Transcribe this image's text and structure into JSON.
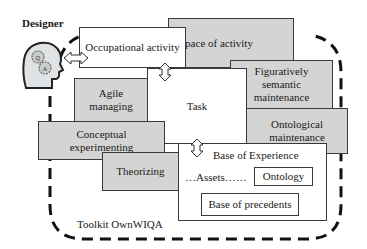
{
  "diagram": {
    "designer_label": "Designer",
    "toolkit_label": "Toolkit OwnWIQA",
    "boxes": {
      "occupational_activity": "Occupational activity",
      "space_of_activity": "Space of activity",
      "agile_managing": "Agile managing",
      "task": "Task",
      "figuratively_semantic_maintenance": "Figuratively semantic maintenance",
      "ontological_maintenance": "Ontological maintenance",
      "conceptual_experimenting": "Conceptual experimenting",
      "theorizing": "Theorizing",
      "base_of_experience": "Base of Experience",
      "assets": "…Assets……",
      "ontology": "Ontology",
      "base_of_precedents": "Base of precedents"
    },
    "icons": [
      "designer-head-gears-icon",
      "double-arrow-horizontal-icon",
      "double-arrow-vertical-icon"
    ],
    "colors": {
      "gray_box": "#d4d4d4",
      "border": "#3a3a3a",
      "dash": "#111111"
    }
  }
}
